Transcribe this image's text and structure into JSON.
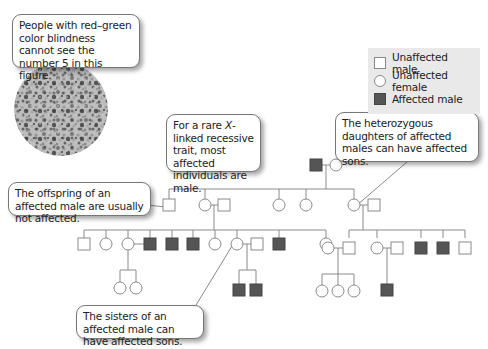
{
  "callouts": {
    "color_blindness": "People with red–green color blindness cannot see the number 5 in this figure.",
    "rare_trait_pre": "For a rare ",
    "rare_trait_x": "X",
    "rare_trait_post": "-linked recessive trait, most affected individuals are male.",
    "heterozygous_daughters": "The heterozygous daughters of affected males can have affected sons.",
    "offspring": "The offspring of an affected male are usually not affected.",
    "sisters": "The sisters of an affected male can have affected sons."
  },
  "legend": {
    "items": [
      {
        "symbol": "open-square",
        "label": "Unaffected male"
      },
      {
        "symbol": "open-circle",
        "label": "Unaffected female"
      },
      {
        "symbol": "filled-square",
        "label": "Affected male"
      }
    ]
  },
  "colors": {
    "line": "#8a8a8a",
    "affected_fill": "#555555",
    "legend_bg": "#e9e9e9"
  },
  "pedigree": {
    "generation_1": [
      "affected male",
      "unaffected female"
    ],
    "generation_2": [
      "unaffected male",
      "unaffected female (+spouse male)",
      "unaffected female",
      "unaffected female",
      "heterozygous female (+spouse male)"
    ],
    "generation_3_left": [
      "unaffected male",
      "unaffected female",
      "unaffected female (+spouse)",
      "affected male",
      "affected male",
      "affected male",
      "unaffected female",
      "unaffected female (+spouse)",
      "affected male"
    ],
    "generation_3_right": [
      "unaffected female (+spouse male)",
      "unaffected female (+spouse male)",
      "affected male",
      "affected male",
      "unaffected male"
    ],
    "generation_4": [
      "2 unaffected females",
      "2 affected males",
      "3 unaffected females",
      "1 affected male"
    ]
  }
}
